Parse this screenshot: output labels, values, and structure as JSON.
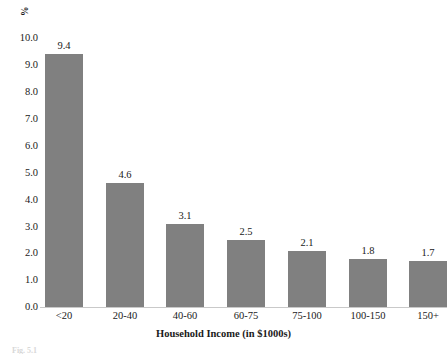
{
  "chart_data": {
    "type": "bar",
    "title": "",
    "xlabel": "Household Income (in $1000s)",
    "ylabel": "%",
    "categories": [
      "<20",
      "20-40",
      "40-60",
      "60-75",
      "75-100",
      "100-150",
      "150+"
    ],
    "values": [
      9.4,
      4.6,
      3.1,
      2.5,
      2.1,
      1.8,
      1.7
    ],
    "value_labels": [
      "9.4",
      "4.6",
      "3.1",
      "2.5",
      "2.1",
      "1.8",
      "1.7"
    ],
    "ylim": [
      0.0,
      10.0
    ],
    "ytick_labels": [
      "10.0",
      "9.0",
      "8.0",
      "7.0",
      "6.0",
      "5.0",
      "4.0",
      "3.0",
      "2.0",
      "1.0",
      "0.0"
    ],
    "ytick_values": [
      10.0,
      9.0,
      8.0,
      7.0,
      6.0,
      5.0,
      4.0,
      3.0,
      2.0,
      1.0,
      0.0
    ],
    "grid": false,
    "legend": false,
    "legend_position": "none",
    "bar_color": "#808080",
    "axis_color": "#c9c9c9",
    "text_color": "#1a1a1a"
  },
  "caption": {
    "fragment": "Fig. 5.1"
  }
}
